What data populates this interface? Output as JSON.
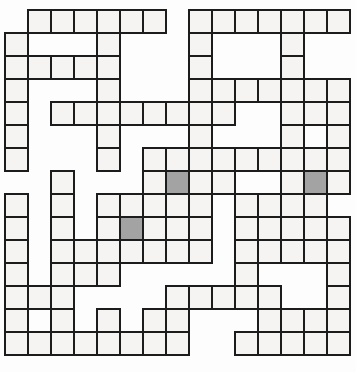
{
  "puzzle": {
    "title": "criss-cross-word-grid",
    "rows": 15,
    "cols": 15,
    "cell_size": 23,
    "origin_x": 4,
    "origin_y": 9,
    "legend": {
      "w": "white-cell",
      "G": "gray-cell",
      ".": "empty"
    },
    "grid_rows": [
      ".wwwwww.wwwwwww",
      "w...w...w...w..",
      "wwwww...w...w..",
      "w...w...wwwwwww",
      "w.wwwwwwww..www",
      "w...w...w...w.w",
      "w...w.wwwwwwwww",
      "..w...wGww..wGw",
      "w.w.wwwww.wwww.",
      "w.w.wGwww.wwwww",
      "w.wwwwwww.wwwww",
      "w.www.....w...w",
      "www....wwwww..w",
      "w.w.w.ww...wwww",
      "wwwwwwww..wwwww"
    ],
    "gray_cells": [
      {
        "row": 8,
        "col": 8
      },
      {
        "row": 8,
        "col": 14
      },
      {
        "row": 10,
        "col": 6
      }
    ],
    "colors": {
      "background": "#fdfdfd",
      "cell_fill": "#f5f4f2",
      "gray_fill": "#a3a3a3",
      "line": "#1c1c1c"
    }
  }
}
